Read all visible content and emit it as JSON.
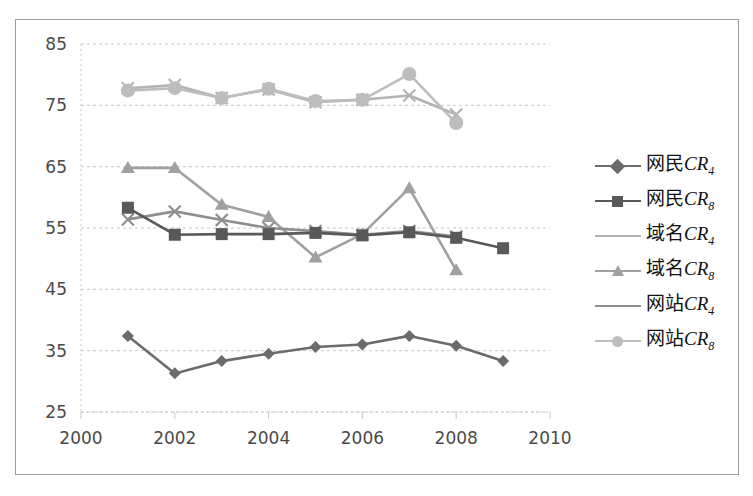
{
  "chart_data": {
    "type": "line",
    "title": "",
    "xlabel": "",
    "ylabel": "",
    "xlim": [
      2000,
      2010
    ],
    "ylim": [
      25,
      85
    ],
    "xticks": [
      2000,
      2002,
      2004,
      2006,
      2008,
      2010
    ],
    "yticks": [
      25,
      35,
      45,
      55,
      65,
      75,
      85
    ],
    "grid": "horizontal-dashed",
    "legend_position": "right",
    "series": [
      {
        "name": "网民CR4",
        "label_cn": "网民",
        "label_cr": "CR",
        "label_sub": "4",
        "marker": "diamond",
        "color": "#6b6b6b",
        "x": [
          2001,
          2002,
          2003,
          2004,
          2005,
          2006,
          2007,
          2008,
          2009
        ],
        "values": [
          37.4,
          31.3,
          33.3,
          34.5,
          35.6,
          36.0,
          37.4,
          35.8,
          33.3
        ]
      },
      {
        "name": "网民CR8",
        "label_cn": "网民",
        "label_cr": "CR",
        "label_sub": "8",
        "marker": "square",
        "color": "#595959",
        "x": [
          2001,
          2002,
          2003,
          2004,
          2005,
          2006,
          2007,
          2008,
          2009
        ],
        "values": [
          58.3,
          53.9,
          54.0,
          54.0,
          54.2,
          53.8,
          54.3,
          53.4,
          51.7
        ]
      },
      {
        "name": "域名CR4",
        "label_cn": "域名",
        "label_cr": "CR",
        "label_sub": "4",
        "marker": "x",
        "color": "#b4b4b4",
        "x": [
          2001,
          2002,
          2003,
          2004,
          2005,
          2006,
          2007,
          2008
        ],
        "values": [
          77.8,
          78.3,
          76.2,
          77.6,
          75.5,
          75.9,
          76.6,
          73.5
        ]
      },
      {
        "name": "域名CR8",
        "label_cn": "域名",
        "label_cr": "CR",
        "label_sub": "8",
        "marker": "triangle",
        "color": "#a0a0a0",
        "x": [
          2001,
          2002,
          2003,
          2004,
          2005,
          2006,
          2007,
          2008
        ],
        "values": [
          64.8,
          64.8,
          58.8,
          56.8,
          50.2,
          54.0,
          61.5,
          48.1
        ]
      },
      {
        "name": "网站CR4",
        "label_cn": "网站",
        "label_cr": "CR",
        "label_sub": "4",
        "marker": "x",
        "color": "#8f8f8f",
        "x": [
          2001,
          2002,
          2003,
          2004,
          2005,
          2006,
          2007,
          2008
        ],
        "values": [
          56.4,
          57.7,
          56.3,
          55.0,
          54.5,
          53.9,
          54.5,
          53.6
        ]
      },
      {
        "name": "网站CR8",
        "label_cn": "网站",
        "label_cr": "CR",
        "label_sub": "8",
        "marker": "circle",
        "color": "#bdbdbd",
        "x": [
          2001,
          2002,
          2003,
          2004,
          2005,
          2006,
          2007,
          2008
        ],
        "values": [
          77.4,
          77.8,
          76.2,
          77.7,
          75.7,
          75.9,
          80.1,
          72.1
        ]
      }
    ]
  },
  "colors": {
    "frame": "#9d9d9d",
    "grid": "#c8c8c8",
    "tick_text": "#4a4a4a",
    "background": "#ffffff"
  }
}
